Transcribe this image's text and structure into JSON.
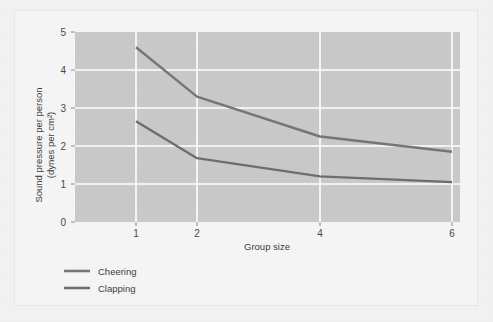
{
  "chart_data": {
    "type": "line",
    "title": "",
    "subtitle": "",
    "xlabel": "Group size",
    "ylabel": "Sound pressure per person\n(dynes per cm²)",
    "ylabel_line1": "Sound pressure per person",
    "ylabel_line2": "(dynes per cm²)",
    "x": [
      1,
      2,
      4,
      6
    ],
    "xtick_labels": [
      "1",
      "2",
      "4",
      "6"
    ],
    "ytick_labels": [
      "0",
      "1",
      "2",
      "3",
      "4",
      "5"
    ],
    "ylim": [
      0,
      5
    ],
    "yticks": [
      0,
      1,
      2,
      3,
      4,
      5
    ],
    "grid": true,
    "grid_color": "#ffffff",
    "plot_background": "#c9c9c9",
    "legend_position": "below-left",
    "series": [
      {
        "name": "Cheering",
        "values": [
          4.6,
          3.3,
          2.25,
          1.85
        ],
        "color": "#767676"
      },
      {
        "name": "Clapping",
        "values": [
          2.65,
          1.68,
          1.2,
          1.05
        ],
        "color": "#6e6e6e"
      }
    ]
  },
  "legend": {
    "items": [
      {
        "label": "Cheering"
      },
      {
        "label": "Clapping"
      }
    ]
  },
  "colors": {
    "page_background": "#f2f2f2",
    "card_background": "#f5f5f5",
    "plot_fill": "#c9c9c9",
    "gridline": "#ffffff",
    "text": "#3d3d3d",
    "tick_text": "#4a4a4a",
    "line_cheering": "#767676",
    "line_clapping": "#6e6e6e"
  }
}
